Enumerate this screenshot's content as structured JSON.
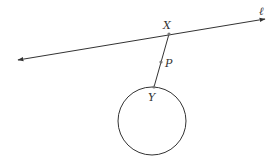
{
  "diagram": {
    "type": "geometry",
    "line": {
      "label": "ℓ",
      "start": [
        18,
        60
      ],
      "end": [
        265,
        19
      ],
      "arrows": "both",
      "label_pos": [
        259,
        14
      ]
    },
    "points": [
      {
        "name": "X",
        "label": "X",
        "pos": [
          169,
          34
        ],
        "label_pos": [
          163,
          28
        ]
      },
      {
        "name": "P",
        "label": "P",
        "pos": [
          161,
          62
        ],
        "label_pos": [
          165,
          66
        ]
      },
      {
        "name": "Y",
        "label": "Y",
        "pos": [
          154,
          87
        ],
        "label_pos": [
          148,
          101
        ]
      }
    ],
    "segment": {
      "from": "X",
      "to": "Y"
    },
    "circle": {
      "center": [
        152,
        121
      ],
      "radius": 34
    },
    "colors": {
      "stroke": "#333333",
      "point": "#777777"
    }
  }
}
